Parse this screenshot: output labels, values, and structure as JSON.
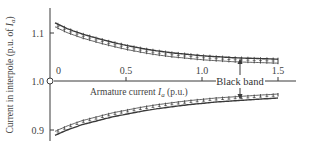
{
  "chart_data": {
    "type": "line",
    "title": "",
    "xlabel": "Armature current I_a (p.u.)",
    "xlabel_parts": {
      "prefix": "Armature current ",
      "var": "I",
      "sub": "a",
      "suffix": " (p.u.)"
    },
    "ylabel": "Current in interpole (p.u. of I_a)",
    "ylabel_parts": {
      "prefix": "Current in interpole (p.u. of ",
      "var": "I",
      "sub": "a",
      "suffix": ")"
    },
    "xlim": [
      0,
      1.5
    ],
    "ylim": [
      0.87,
      1.14
    ],
    "x_ticks": [
      {
        "value": 0,
        "label": "0"
      },
      {
        "value": 0.5,
        "label": "0.5"
      },
      {
        "value": 1.0,
        "label": "1.0"
      },
      {
        "value": 1.5,
        "label": "1.5"
      }
    ],
    "y_ticks": [
      {
        "value": 1.1,
        "label": "1.1"
      },
      {
        "value": 1.0,
        "label": "1.0"
      },
      {
        "value": 0.9,
        "label": "0.9"
      }
    ],
    "grid": false,
    "legend": null,
    "series": [
      {
        "name": "Upper limit of black band",
        "style": "hatched-below",
        "x": [
          0.02,
          0.1,
          0.2,
          0.3,
          0.4,
          0.5,
          0.6,
          0.7,
          0.8,
          0.9,
          1.0,
          1.1,
          1.2,
          1.3,
          1.4,
          1.5
        ],
        "values": [
          1.12,
          1.108,
          1.097,
          1.088,
          1.08,
          1.073,
          1.067,
          1.062,
          1.058,
          1.055,
          1.052,
          1.05,
          1.048,
          1.047,
          1.046,
          1.045
        ]
      },
      {
        "name": "Lower limit of black band",
        "style": "hatched-above",
        "x": [
          0.02,
          0.1,
          0.2,
          0.3,
          0.4,
          0.5,
          0.6,
          0.7,
          0.8,
          0.9,
          1.0,
          1.1,
          1.2,
          1.3,
          1.4,
          1.5
        ],
        "values": [
          0.888,
          0.899,
          0.91,
          0.918,
          0.926,
          0.932,
          0.938,
          0.943,
          0.947,
          0.951,
          0.954,
          0.957,
          0.959,
          0.961,
          0.963,
          0.965
        ]
      }
    ],
    "annotations": [
      {
        "text": "Black band",
        "x": 1.25,
        "y": 1.0,
        "arrows_to": [
          "upper",
          "lower"
        ]
      },
      {
        "text": "origin-marker",
        "shape": "open-circle",
        "x": 0,
        "y": 1.0
      }
    ]
  },
  "labels": {
    "black_band": "Black band",
    "y_tick_1_1": "1.1",
    "y_tick_1_0": "1.0",
    "y_tick_0_9": "0.9",
    "x_tick_0": "0",
    "x_tick_0_5": "0.5",
    "x_tick_1_0": "1.0",
    "x_tick_1_5": "1.5",
    "xlabel_prefix": "Armature current ",
    "xlabel_var": "I",
    "xlabel_sub": "a",
    "xlabel_suffix": " (p.u.)",
    "ylabel_prefix": "Current in interpole (p.u. of ",
    "ylabel_var": "I",
    "ylabel_sub": "a",
    "ylabel_suffix": ")"
  },
  "colors": {
    "ink": "#3a3a3a",
    "background": "#ffffff"
  }
}
